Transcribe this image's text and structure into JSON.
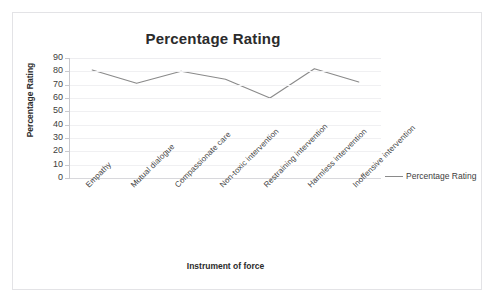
{
  "frame": {
    "ghost_text": "                                                                    "
  },
  "legend": {
    "position": "right",
    "entry_label": "Percentage Rating",
    "marker": "line-marker-icon"
  },
  "chart_data": {
    "type": "line",
    "title": "Percentage Rating",
    "xlabel": "Instrument of force",
    "ylabel": "Percentage Rating",
    "categories": [
      "Empathy",
      "Mutual dialogue",
      "Compassionate care",
      "Non-toxic intervention",
      "Restraining intervention",
      "Harmless  intervention",
      "Inoffensive intervention"
    ],
    "values": [
      81,
      71,
      80,
      74,
      60,
      82,
      72
    ],
    "series": [
      {
        "name": "Percentage Rating",
        "values": [
          81,
          71,
          80,
          74,
          60,
          82,
          72
        ],
        "color": "#8a8a8a"
      }
    ],
    "ylim": [
      0,
      90
    ],
    "ytick_values": [
      90,
      80,
      70,
      60,
      50,
      40,
      30,
      20,
      10,
      0
    ],
    "ytick_labels": [
      "90",
      "80",
      "70",
      "60",
      "50",
      "40",
      "30",
      "20",
      "10",
      "0"
    ],
    "ystep": 10,
    "grid": true,
    "grid_axis": "y",
    "legend_position": "right",
    "line_color": "#8a8a8a",
    "grid_color": "#f0f0f2",
    "text_color": "#2b2b2b",
    "background": "#ffffff"
  }
}
